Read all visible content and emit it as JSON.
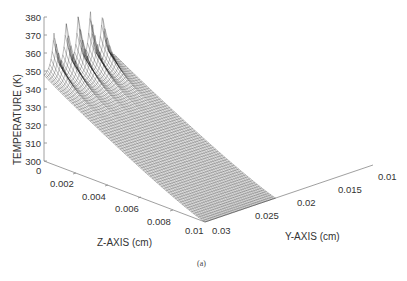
{
  "chart_data": {
    "type": "surface3d",
    "title": "",
    "caption": "(a)",
    "zlabel": "TEMPERATURE  (K)",
    "xlabel": "Z-AXIS  (cm)",
    "ylabel": "Y-AXIS  (cm)",
    "zlim": [
      300,
      380
    ],
    "xlim": [
      0,
      0.01
    ],
    "ylim": [
      0.01,
      0.03
    ],
    "z_ticks": [
      "380",
      "370",
      "360",
      "350",
      "340",
      "330",
      "320",
      "310",
      "300"
    ],
    "x_ticks": [
      "0",
      "0.002",
      "0.004",
      "0.006",
      "0.008",
      "0.01"
    ],
    "y_ticks": [
      "0.01",
      "0.015",
      "0.02",
      "0.025",
      "0.03"
    ],
    "grid": false,
    "style": "black wireframe mesh",
    "peaks": {
      "count": 5,
      "description": "Five sharp temperature spikes along the z=0 edge near y=0.01 cm, decaying rapidly into a flat sloping plane",
      "peak_temperatures_K": [
        370,
        374,
        376,
        376,
        372
      ]
    },
    "surface_profile": {
      "near_edge_z0": "approx 345-350 K base between spikes",
      "far_corner_z0.01_y0.03": "approx 300 K",
      "trend": "temperature decreases with increasing Z and increasing Y"
    }
  }
}
